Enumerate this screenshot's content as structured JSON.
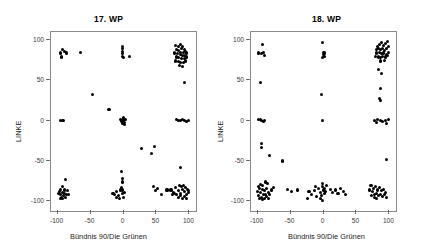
{
  "figure": {
    "background": "#ffffff",
    "point_color": "#000000",
    "frame_color": "#8a8a8a",
    "width": 435,
    "height": 251
  },
  "chart_data": [
    {
      "type": "scatter",
      "title": "17. WP",
      "xlabel": "Bündnis 90/Die Grünen",
      "ylabel": "LINKE",
      "xlim": [
        -110,
        110
      ],
      "ylim": [
        -112,
        110
      ],
      "xticks": [
        -100,
        -50,
        0,
        50,
        100
      ],
      "xticklabels": [
        "-100",
        "-50",
        "0",
        "50",
        "100"
      ],
      "yticks": [
        100,
        50,
        0,
        -50,
        -100
      ],
      "yticklabels": [
        "100",
        "50",
        "0",
        "-50",
        "-100"
      ],
      "grid": false,
      "legend": false,
      "marker": "filled-circle",
      "points": [
        [
          -93,
          88
        ],
        [
          -95,
          84
        ],
        [
          -90,
          86
        ],
        [
          -94,
          79
        ],
        [
          -86,
          84
        ],
        [
          -65,
          85
        ],
        [
          -1,
          92
        ],
        [
          -1,
          89
        ],
        [
          -1,
          86
        ],
        [
          -1,
          83
        ],
        [
          -1,
          80
        ],
        [
          0,
          78
        ],
        [
          9,
          80
        ],
        [
          79,
          93
        ],
        [
          83,
          92
        ],
        [
          86,
          94
        ],
        [
          88,
          90
        ],
        [
          90,
          92
        ],
        [
          92,
          88
        ],
        [
          80,
          88
        ],
        [
          84,
          87
        ],
        [
          87,
          85
        ],
        [
          91,
          85
        ],
        [
          94,
          86
        ],
        [
          78,
          84
        ],
        [
          82,
          83
        ],
        [
          86,
          82
        ],
        [
          89,
          81
        ],
        [
          93,
          81
        ],
        [
          96,
          84
        ],
        [
          80,
          79
        ],
        [
          84,
          78
        ],
        [
          88,
          77
        ],
        [
          92,
          77
        ],
        [
          95,
          79
        ],
        [
          79,
          74
        ],
        [
          83,
          73
        ],
        [
          87,
          72
        ],
        [
          91,
          72
        ],
        [
          94,
          74
        ],
        [
          85,
          68
        ],
        [
          89,
          67
        ],
        [
          92,
          47
        ],
        [
          -47,
          33
        ],
        [
          -22,
          14
        ],
        [
          -95,
          0
        ],
        [
          -93,
          0
        ],
        [
          -91,
          0
        ],
        [
          -2,
          2
        ],
        [
          -1,
          0
        ],
        [
          0,
          -1
        ],
        [
          1,
          1
        ],
        [
          2,
          -2
        ],
        [
          -3,
          -1
        ],
        [
          3,
          2
        ],
        [
          0,
          4
        ],
        [
          -2,
          -4
        ],
        [
          2,
          -5
        ],
        [
          -4,
          2
        ],
        [
          84,
          0
        ],
        [
          87,
          0
        ],
        [
          90,
          1
        ],
        [
          93,
          0
        ],
        [
          96,
          -1
        ],
        [
          81,
          1
        ],
        [
          99,
          0
        ],
        [
          27,
          -35
        ],
        [
          47,
          -32
        ],
        [
          42,
          -41
        ],
        [
          86,
          -58
        ],
        [
          -3,
          -63
        ],
        [
          -1,
          -72
        ],
        [
          -1,
          -76
        ],
        [
          -88,
          -73
        ],
        [
          -92,
          -82
        ],
        [
          -95,
          -85
        ],
        [
          -90,
          -86
        ],
        [
          -97,
          -88
        ],
        [
          -93,
          -89
        ],
        [
          -89,
          -90
        ],
        [
          -96,
          -92
        ],
        [
          -91,
          -93
        ],
        [
          -94,
          -95
        ],
        [
          -87,
          -91
        ],
        [
          -99,
          -90
        ],
        [
          -85,
          -87
        ],
        [
          -92,
          -96
        ],
        [
          -96,
          -97
        ],
        [
          -88,
          -95
        ],
        [
          -84,
          -92
        ],
        [
          -16,
          -90
        ],
        [
          -13,
          -92
        ],
        [
          -10,
          -88
        ],
        [
          -7,
          -93
        ],
        [
          -4,
          -86
        ],
        [
          -2,
          -90
        ],
        [
          0,
          -95
        ],
        [
          -6,
          -96
        ],
        [
          -11,
          -95
        ],
        [
          -1,
          -86
        ],
        [
          -3,
          -83
        ],
        [
          2,
          -89
        ],
        [
          46,
          -82
        ],
        [
          52,
          -84
        ],
        [
          49,
          -87
        ],
        [
          66,
          -86
        ],
        [
          58,
          -92
        ],
        [
          72,
          -86
        ],
        [
          76,
          -89
        ],
        [
          79,
          -83
        ],
        [
          83,
          -87
        ],
        [
          86,
          -90
        ],
        [
          89,
          -85
        ],
        [
          92,
          -88
        ],
        [
          95,
          -91
        ],
        [
          98,
          -87
        ],
        [
          81,
          -92
        ],
        [
          84,
          -95
        ],
        [
          87,
          -93
        ],
        [
          90,
          -96
        ],
        [
          93,
          -94
        ],
        [
          96,
          -96
        ],
        [
          78,
          -90
        ],
        [
          99,
          -89
        ],
        [
          74,
          -92
        ],
        [
          85,
          -80
        ],
        [
          88,
          -82
        ],
        [
          91,
          -80
        ],
        [
          94,
          -83
        ],
        [
          97,
          -85
        ]
      ]
    },
    {
      "type": "scatter",
      "title": "18. WP",
      "xlabel": "Bündnis 90/Die Grünen",
      "ylabel": "LINKE",
      "xlim": [
        -110,
        110
      ],
      "ylim": [
        -112,
        110
      ],
      "xticks": [
        -100,
        -50,
        0,
        50,
        100
      ],
      "xticklabels": [
        "-100",
        "-50",
        "0",
        "50",
        "100"
      ],
      "yticks": [
        100,
        50,
        0,
        -50,
        -100
      ],
      "yticklabels": [
        "100",
        "50",
        "0",
        "-50",
        "-100"
      ],
      "grid": false,
      "legend": false,
      "marker": "filled-circle",
      "points": [
        [
          -93,
          94
        ],
        [
          -99,
          84
        ],
        [
          -94,
          83
        ],
        [
          -91,
          85
        ],
        [
          -90,
          81
        ],
        [
          -96,
          47
        ],
        [
          -1,
          97
        ],
        [
          0,
          85
        ],
        [
          0,
          82
        ],
        [
          1,
          80
        ],
        [
          -1,
          78
        ],
        [
          2,
          84
        ],
        [
          82,
          92
        ],
        [
          85,
          95
        ],
        [
          88,
          97
        ],
        [
          91,
          93
        ],
        [
          94,
          96
        ],
        [
          97,
          98
        ],
        [
          80,
          88
        ],
        [
          84,
          90
        ],
        [
          87,
          88
        ],
        [
          90,
          89
        ],
        [
          93,
          87
        ],
        [
          96,
          90
        ],
        [
          99,
          92
        ],
        [
          81,
          84
        ],
        [
          85,
          85
        ],
        [
          88,
          83
        ],
        [
          91,
          84
        ],
        [
          95,
          82
        ],
        [
          98,
          85
        ],
        [
          79,
          80
        ],
        [
          83,
          79
        ],
        [
          87,
          78
        ],
        [
          90,
          80
        ],
        [
          94,
          79
        ],
        [
          97,
          81
        ],
        [
          86,
          74
        ],
        [
          92,
          75
        ],
        [
          83,
          64
        ],
        [
          88,
          59
        ],
        [
          86,
          40
        ],
        [
          85,
          28
        ],
        [
          87,
          25
        ],
        [
          -3,
          33
        ],
        [
          -96,
          2
        ],
        [
          -94,
          0
        ],
        [
          -91,
          -1
        ],
        [
          -98,
          1
        ],
        [
          -89,
          0
        ],
        [
          -2,
          0
        ],
        [
          78,
          0
        ],
        [
          82,
          1
        ],
        [
          86,
          0
        ],
        [
          90,
          -1
        ],
        [
          94,
          0
        ],
        [
          98,
          1
        ],
        [
          80,
          -2
        ],
        [
          96,
          -3
        ],
        [
          -94,
          -28
        ],
        [
          -94,
          -33
        ],
        [
          -82,
          -43
        ],
        [
          -62,
          -50
        ],
        [
          96,
          -48
        ],
        [
          -88,
          -76
        ],
        [
          -96,
          -79
        ],
        [
          -92,
          -80
        ],
        [
          -99,
          -82
        ],
        [
          -85,
          -78
        ],
        [
          -97,
          -84
        ],
        [
          -93,
          -85
        ],
        [
          -90,
          -87
        ],
        [
          -86,
          -84
        ],
        [
          -100,
          -88
        ],
        [
          -95,
          -89
        ],
        [
          -91,
          -91
        ],
        [
          -88,
          -92
        ],
        [
          -84,
          -89
        ],
        [
          -98,
          -93
        ],
        [
          -94,
          -95
        ],
        [
          -90,
          -96
        ],
        [
          -86,
          -94
        ],
        [
          -82,
          -91
        ],
        [
          -79,
          -86
        ],
        [
          -76,
          -83
        ],
        [
          -83,
          -96
        ],
        [
          -97,
          -97
        ],
        [
          -92,
          -98
        ],
        [
          -55,
          -85
        ],
        [
          -48,
          -88
        ],
        [
          -40,
          -86
        ],
        [
          -22,
          -88
        ],
        [
          -18,
          -91
        ],
        [
          -14,
          -87
        ],
        [
          -11,
          -94
        ],
        [
          -24,
          -96
        ],
        [
          -8,
          -84
        ],
        [
          -5,
          -89
        ],
        [
          -12,
          -82
        ],
        [
          -2,
          -78
        ],
        [
          -1,
          -82
        ],
        [
          0,
          -86
        ],
        [
          1,
          -90
        ],
        [
          -3,
          -93
        ],
        [
          2,
          -84
        ],
        [
          3,
          -88
        ],
        [
          -4,
          -96
        ],
        [
          4,
          -80
        ],
        [
          -2,
          -99
        ],
        [
          10,
          -85
        ],
        [
          14,
          -89
        ],
        [
          18,
          -86
        ],
        [
          22,
          -90
        ],
        [
          26,
          -84
        ],
        [
          30,
          -88
        ],
        [
          34,
          -92
        ],
        [
          72,
          -80
        ],
        [
          76,
          -84
        ],
        [
          79,
          -82
        ],
        [
          82,
          -86
        ],
        [
          85,
          -83
        ],
        [
          88,
          -87
        ],
        [
          91,
          -85
        ],
        [
          94,
          -89
        ],
        [
          74,
          -88
        ],
        [
          77,
          -91
        ],
        [
          80,
          -90
        ],
        [
          83,
          -93
        ],
        [
          86,
          -91
        ],
        [
          89,
          -94
        ],
        [
          92,
          -92
        ],
        [
          95,
          -95
        ],
        [
          78,
          -95
        ],
        [
          81,
          -97
        ],
        [
          70,
          -86
        ],
        [
          73,
          -93
        ]
      ]
    }
  ]
}
